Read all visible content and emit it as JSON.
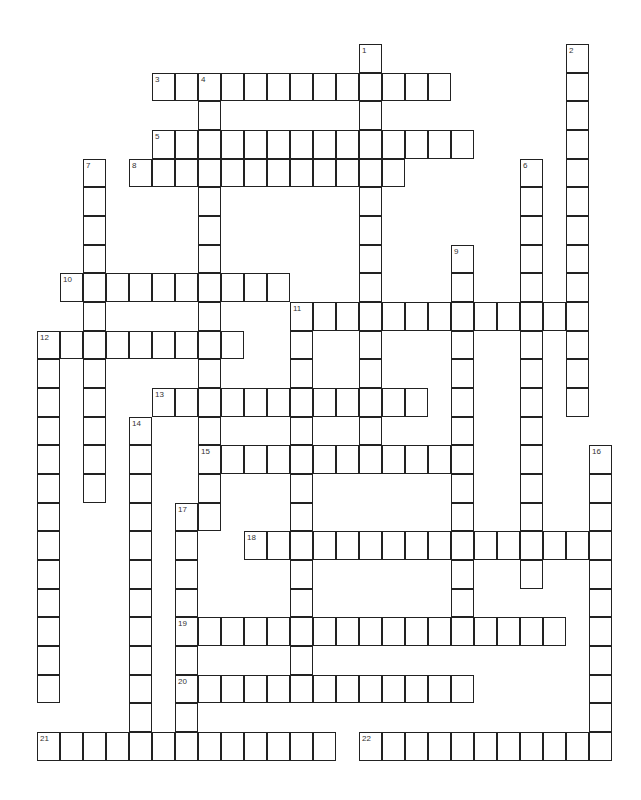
{
  "puzzle": {
    "type": "crossword",
    "grid": {
      "origin_x": 37,
      "origin_y": 44,
      "cell_w": 23,
      "cell_h": 28.67
    },
    "words": [
      {
        "num": "1",
        "dir": "down",
        "col": 14,
        "row": 0,
        "len": 15
      },
      {
        "num": "2",
        "dir": "down",
        "col": 23,
        "row": 0,
        "len": 13
      },
      {
        "num": "3",
        "dir": "across",
        "col": 5,
        "row": 1,
        "len": 13
      },
      {
        "num": "4",
        "dir": "down",
        "col": 7,
        "row": 1,
        "len": 16
      },
      {
        "num": "5",
        "dir": "across",
        "col": 5,
        "row": 3,
        "len": 14
      },
      {
        "num": "6",
        "dir": "down",
        "col": 21,
        "row": 4,
        "len": 15
      },
      {
        "num": "7",
        "dir": "down",
        "col": 2,
        "row": 4,
        "len": 12
      },
      {
        "num": "8",
        "dir": "across",
        "col": 4,
        "row": 4,
        "len": 12
      },
      {
        "num": "9",
        "dir": "down",
        "col": 18,
        "row": 7,
        "len": 14
      },
      {
        "num": "10",
        "dir": "across",
        "col": 1,
        "row": 8,
        "len": 10
      },
      {
        "num": "11",
        "dir": "across",
        "col": 11,
        "row": 9,
        "len": 13
      },
      {
        "num": "11",
        "dir": "down",
        "col": 11,
        "row": 9,
        "len": 14
      },
      {
        "num": "12",
        "dir": "across",
        "col": 0,
        "row": 10,
        "len": 9
      },
      {
        "num": "12",
        "dir": "down",
        "col": 0,
        "row": 10,
        "len": 13
      },
      {
        "num": "13",
        "dir": "across",
        "col": 5,
        "row": 12,
        "len": 12
      },
      {
        "num": "14",
        "dir": "down",
        "col": 4,
        "row": 13,
        "len": 12
      },
      {
        "num": "15",
        "dir": "across",
        "col": 7,
        "row": 14,
        "len": 12
      },
      {
        "num": "16",
        "dir": "down",
        "col": 24,
        "row": 14,
        "len": 11
      },
      {
        "num": "17",
        "dir": "down",
        "col": 6,
        "row": 16,
        "len": 9
      },
      {
        "num": "18",
        "dir": "across",
        "col": 9,
        "row": 17,
        "len": 16
      },
      {
        "num": "19",
        "dir": "across",
        "col": 6,
        "row": 20,
        "len": 17
      },
      {
        "num": "20",
        "dir": "across",
        "col": 6,
        "row": 22,
        "len": 13
      },
      {
        "num": "21",
        "dir": "across",
        "col": 0,
        "row": 24,
        "len": 13
      },
      {
        "num": "22",
        "dir": "across",
        "col": 14,
        "row": 24,
        "len": 11
      }
    ]
  }
}
